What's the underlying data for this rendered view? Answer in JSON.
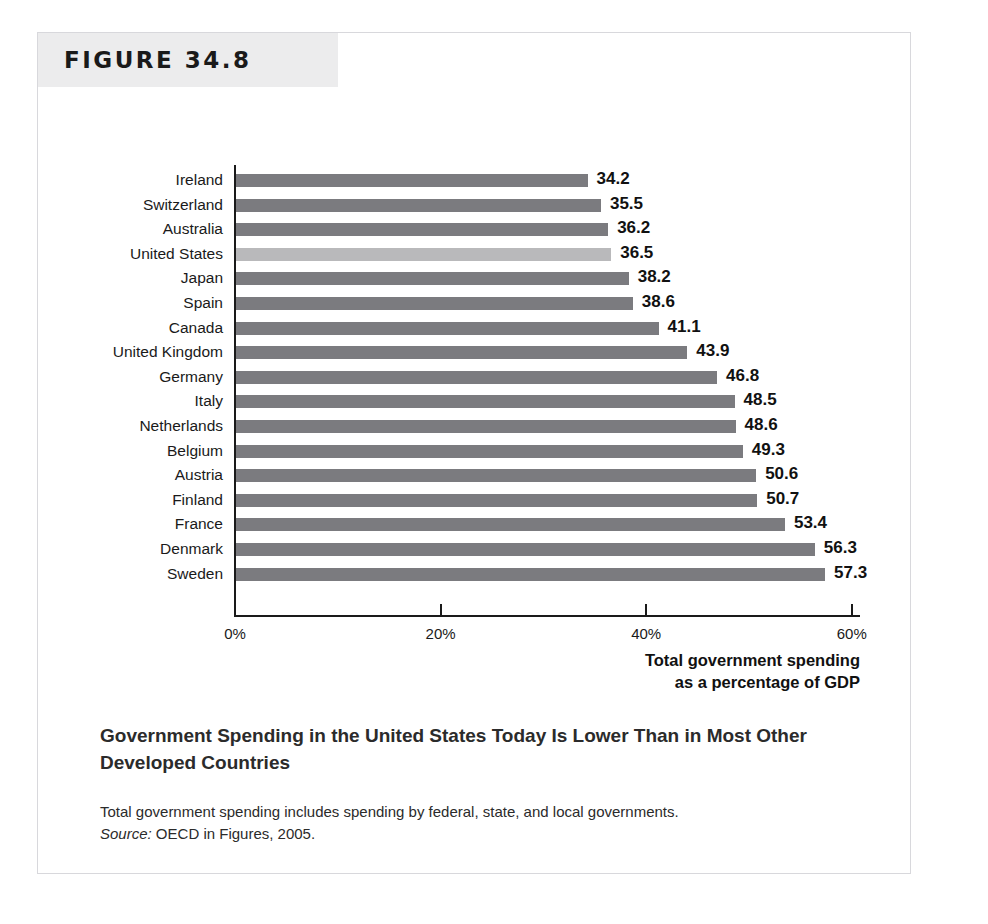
{
  "figure": {
    "number_label": "FIGURE 34.8",
    "caption_title": "Government Spending in the United States Today Is Lower Than in Most Other Developed Countries",
    "caption_note": "Total government spending includes spending by federal, state, and local governments.",
    "source_label": "Source:",
    "source_text": " OECD in Figures, 2005."
  },
  "colors": {
    "bar": "#7b7b7f",
    "bar_highlight": "#b9b9bb",
    "axis": "#1a1a1a",
    "banner_background": "#ececed",
    "card_border": "#d8d8dc",
    "text": "#1a1a1a"
  },
  "chart_data": {
    "type": "bar",
    "orientation": "horizontal",
    "title": "",
    "xlabel": "Total government spending as a percentage of GDP",
    "xlabel_line1": "Total government spending",
    "xlabel_line2": "as a percentage of GDP",
    "ylabel": "",
    "xlim": [
      0,
      60
    ],
    "grid": false,
    "legend": "none",
    "tick_labels": [
      "0%",
      "20%",
      "40%",
      "60%"
    ],
    "tick_values": [
      0,
      20,
      40,
      60
    ],
    "highlight_category": "United States",
    "categories": [
      "Ireland",
      "Switzerland",
      "Australia",
      "United States",
      "Japan",
      "Spain",
      "Canada",
      "United Kingdom",
      "Germany",
      "Italy",
      "Netherlands",
      "Belgium",
      "Austria",
      "Finland",
      "France",
      "Denmark",
      "Sweden"
    ],
    "values": [
      34.2,
      35.5,
      36.2,
      36.5,
      38.2,
      38.6,
      41.1,
      43.9,
      46.8,
      48.5,
      48.6,
      49.3,
      50.6,
      50.7,
      53.4,
      56.3,
      57.3
    ],
    "value_labels": [
      "34.2",
      "35.5",
      "36.2",
      "36.5",
      "38.2",
      "38.6",
      "41.1",
      "43.9",
      "46.8",
      "48.5",
      "48.6",
      "49.3",
      "50.6",
      "50.7",
      "53.4",
      "56.3",
      "57.3"
    ]
  }
}
